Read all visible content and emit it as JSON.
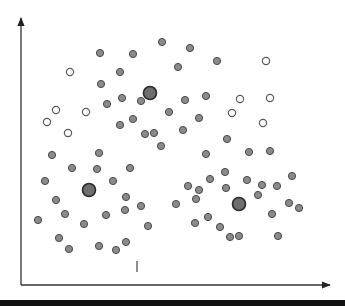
{
  "diagram": {
    "type": "scatter-clustering",
    "canvas": {
      "width": 345,
      "height": 306
    },
    "axes": {
      "origin": [
        21,
        285
      ],
      "y_axis_end": [
        21,
        18
      ],
      "x_axis_end": [
        330,
        285
      ],
      "color": "#333333"
    },
    "colors": {
      "point_fill": "#8a8a8a",
      "point_stroke": "#4a4a4a",
      "hollow_fill": "#ffffff",
      "hollow_stroke": "#5a5a5a",
      "centroid_fill": "#6e6e6e",
      "centroid_stroke": "#2a2a2a",
      "bottom_bar": "#111111"
    },
    "centroids": [
      {
        "x": 150,
        "y": 93
      },
      {
        "x": 89,
        "y": 190
      },
      {
        "x": 239,
        "y": 204
      }
    ],
    "hollow_points": [
      {
        "x": 70,
        "y": 72
      },
      {
        "x": 266,
        "y": 61
      },
      {
        "x": 56,
        "y": 110
      },
      {
        "x": 47,
        "y": 122
      },
      {
        "x": 86,
        "y": 112
      },
      {
        "x": 68,
        "y": 133
      },
      {
        "x": 240,
        "y": 99
      },
      {
        "x": 270,
        "y": 98
      },
      {
        "x": 232,
        "y": 113
      },
      {
        "x": 263,
        "y": 123
      }
    ],
    "points": [
      {
        "x": 100,
        "y": 53
      },
      {
        "x": 133,
        "y": 54
      },
      {
        "x": 162,
        "y": 42
      },
      {
        "x": 190,
        "y": 48
      },
      {
        "x": 217,
        "y": 61
      },
      {
        "x": 178,
        "y": 67
      },
      {
        "x": 120,
        "y": 72
      },
      {
        "x": 101,
        "y": 84
      },
      {
        "x": 206,
        "y": 96
      },
      {
        "x": 185,
        "y": 100
      },
      {
        "x": 141,
        "y": 101
      },
      {
        "x": 107,
        "y": 104
      },
      {
        "x": 122,
        "y": 98
      },
      {
        "x": 169,
        "y": 112
      },
      {
        "x": 133,
        "y": 119
      },
      {
        "x": 120,
        "y": 125
      },
      {
        "x": 145,
        "y": 134
      },
      {
        "x": 154,
        "y": 133
      },
      {
        "x": 161,
        "y": 146
      },
      {
        "x": 183,
        "y": 130
      },
      {
        "x": 199,
        "y": 118
      },
      {
        "x": 227,
        "y": 139
      },
      {
        "x": 206,
        "y": 154
      },
      {
        "x": 249,
        "y": 152
      },
      {
        "x": 270,
        "y": 151
      },
      {
        "x": 225,
        "y": 172
      },
      {
        "x": 210,
        "y": 179
      },
      {
        "x": 247,
        "y": 180
      },
      {
        "x": 292,
        "y": 176
      },
      {
        "x": 262,
        "y": 185
      },
      {
        "x": 277,
        "y": 186
      },
      {
        "x": 226,
        "y": 188
      },
      {
        "x": 258,
        "y": 195
      },
      {
        "x": 199,
        "y": 190
      },
      {
        "x": 176,
        "y": 204
      },
      {
        "x": 188,
        "y": 186
      },
      {
        "x": 196,
        "y": 199
      },
      {
        "x": 289,
        "y": 203
      },
      {
        "x": 299,
        "y": 208
      },
      {
        "x": 272,
        "y": 214
      },
      {
        "x": 208,
        "y": 217
      },
      {
        "x": 195,
        "y": 223
      },
      {
        "x": 220,
        "y": 227
      },
      {
        "x": 230,
        "y": 237
      },
      {
        "x": 239,
        "y": 236
      },
      {
        "x": 278,
        "y": 236
      },
      {
        "x": 52,
        "y": 155
      },
      {
        "x": 99,
        "y": 153
      },
      {
        "x": 72,
        "y": 168
      },
      {
        "x": 97,
        "y": 169
      },
      {
        "x": 130,
        "y": 168
      },
      {
        "x": 113,
        "y": 181
      },
      {
        "x": 45,
        "y": 181
      },
      {
        "x": 56,
        "y": 200
      },
      {
        "x": 65,
        "y": 214
      },
      {
        "x": 84,
        "y": 224
      },
      {
        "x": 106,
        "y": 215
      },
      {
        "x": 125,
        "y": 210
      },
      {
        "x": 126,
        "y": 197
      },
      {
        "x": 141,
        "y": 206
      },
      {
        "x": 148,
        "y": 226
      },
      {
        "x": 38,
        "y": 220
      },
      {
        "x": 59,
        "y": 238
      },
      {
        "x": 69,
        "y": 249
      },
      {
        "x": 99,
        "y": 246
      },
      {
        "x": 116,
        "y": 250
      },
      {
        "x": 126,
        "y": 242
      }
    ],
    "tick_mark": {
      "x": 137,
      "y1": 261,
      "y2": 272
    }
  }
}
